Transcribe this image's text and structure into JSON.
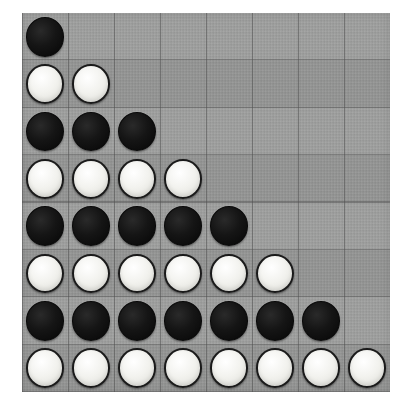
{
  "app": {
    "title": "Reversi Board",
    "board_label": "8x8 reversi board with staircase stone pattern"
  },
  "board": {
    "rows": 8,
    "columns": 8,
    "background_color": "#999a99",
    "grid_line_color": "#505050",
    "black_stone_color": "#111111",
    "white_stone_color": "#f2f2ee",
    "column_labels": [
      "a",
      "b",
      "c",
      "d",
      "e",
      "f",
      "g",
      "h"
    ],
    "row_labels": [
      "1",
      "2",
      "3",
      "4",
      "5",
      "6",
      "7",
      "8"
    ],
    "black_count": 16,
    "white_count": 20,
    "empty_count": 28,
    "cells": [
      [
        "black",
        "empty",
        "empty",
        "empty",
        "empty",
        "empty",
        "empty",
        "empty"
      ],
      [
        "white",
        "white",
        "empty",
        "empty",
        "empty",
        "empty",
        "empty",
        "empty"
      ],
      [
        "black",
        "black",
        "black",
        "empty",
        "empty",
        "empty",
        "empty",
        "empty"
      ],
      [
        "white",
        "white",
        "white",
        "white",
        "empty",
        "empty",
        "empty",
        "empty"
      ],
      [
        "black",
        "black",
        "black",
        "black",
        "black",
        "empty",
        "empty",
        "empty"
      ],
      [
        "white",
        "white",
        "white",
        "white",
        "white",
        "white",
        "empty",
        "empty"
      ],
      [
        "black",
        "black",
        "black",
        "black",
        "black",
        "black",
        "black",
        "empty"
      ],
      [
        "white",
        "white",
        "white",
        "white",
        "white",
        "white",
        "white",
        "white"
      ]
    ]
  }
}
